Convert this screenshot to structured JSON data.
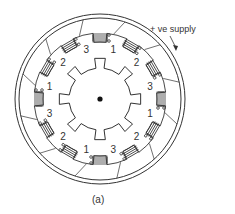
{
  "figure": {
    "caption": "(a)",
    "supply_label": "+ ve  supply",
    "stator": {
      "pole_count": 12,
      "phase_labels": [
        "1",
        "2",
        "3",
        "1",
        "2",
        "3",
        "1",
        "2",
        "3",
        "1",
        "2",
        "3"
      ]
    },
    "rotor": {
      "tooth_count": 8
    },
    "colors": {
      "line": "#333333",
      "background": "#ffffff"
    }
  }
}
